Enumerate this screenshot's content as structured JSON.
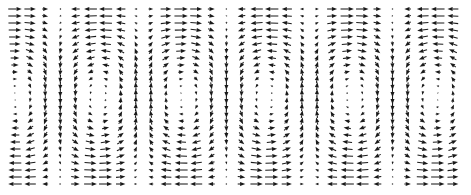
{
  "figure": {
    "type": "quiver-vector-field",
    "title": "",
    "background_color": "#ffffff",
    "arrow_color": "#1a1a1a",
    "width_px": 471,
    "height_px": 195
  },
  "chart_data": {
    "type": "scatter",
    "plot_kind": "quiver",
    "title": "",
    "subtitle": "",
    "xlabel": "",
    "ylabel": "",
    "legend": [],
    "annotations": [],
    "grid": false,
    "axes_visible": false,
    "tick_labels_x": [],
    "tick_labels_y": [],
    "xlim": [
      0,
      1
    ],
    "ylim": [
      0,
      1
    ],
    "field": {
      "description": "Two-dimensional convection-roll (Rayleigh-Benard style) velocity field rendered as a grid of arrow glyphs. Horizontal component flows to the right along the top edge and to the left along the bottom edge; vertical component alternates up and down between adjacent cells, producing counter-rotating rolls.",
      "model": "u = A*cos(k*x)*cos(p*y) ; v = B*sin(k*x)*sin(p*y)",
      "u_amplitude": 1.0,
      "v_amplitude": 0.62,
      "x_wavenumber_cycles": 2.6,
      "y_half_cycles": 1.0,
      "roll_count": 5,
      "grid_columns": 30,
      "grid_rows": 26,
      "origin_x_px": 15,
      "origin_y_px": 9,
      "spacing_x_px": 15.1,
      "spacing_y_px": 7.0,
      "max_arrow_length_px": 13.5,
      "head_length_px": 5.2,
      "head_width_px": 4.0,
      "min_magnitude_dot": 0.06,
      "dot_radius_px": 0.75
    },
    "sampled_vectors": [
      {
        "label": "top-left",
        "x_px": 20,
        "y_px": 14,
        "u": 0.93,
        "v": 0.3
      },
      {
        "label": "top-center",
        "x_px": 232,
        "y_px": 14,
        "u": 0.97,
        "v": -0.05
      },
      {
        "label": "top-right",
        "x_px": 455,
        "y_px": 14,
        "u": 0.88,
        "v": 0.33
      },
      {
        "label": "mid-left",
        "x_px": 20,
        "y_px": 97,
        "u": 0.0,
        "v": -0.58
      },
      {
        "label": "mid-cell-up",
        "x_px": 232,
        "y_px": 97,
        "u": 0.02,
        "v": 0.04
      },
      {
        "label": "mid-cell-down",
        "x_px": 140,
        "y_px": 97,
        "u": -0.01,
        "v": 0.55
      },
      {
        "label": "bottom-left",
        "x_px": 20,
        "y_px": 181,
        "u": -0.92,
        "v": 0.29
      },
      {
        "label": "bottom-center",
        "x_px": 232,
        "y_px": 181,
        "u": -0.96,
        "v": -0.04
      },
      {
        "label": "bottom-right",
        "x_px": 455,
        "y_px": 181,
        "u": -0.87,
        "v": 0.31
      }
    ]
  }
}
